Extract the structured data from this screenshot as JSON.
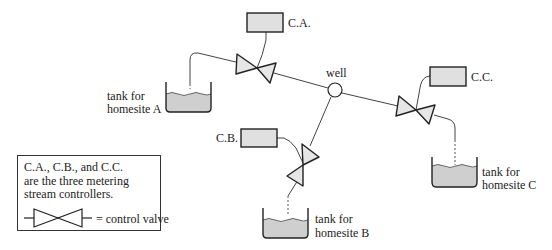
{
  "diagram": {
    "controllers": [
      {
        "id": "ca",
        "label": "C.A."
      },
      {
        "id": "cb",
        "label": "C.B."
      },
      {
        "id": "cc",
        "label": "C.C."
      }
    ],
    "well_label": "well",
    "tanks": [
      {
        "id": "a",
        "line1": "tank for",
        "line2": "homesite A"
      },
      {
        "id": "b",
        "line1": "tank for",
        "line2": "homesite B"
      },
      {
        "id": "c",
        "line1": "tank for",
        "line2": "homesite C"
      }
    ],
    "legend": {
      "line1": "C.A., C.B., and C.C.",
      "line2": "are the three metering",
      "line3": "stream controllers.",
      "valve_text": "= control valve"
    },
    "colors": {
      "fill": "#dcdcdc",
      "stroke": "#333333"
    }
  }
}
